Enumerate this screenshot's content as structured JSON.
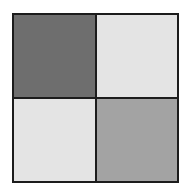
{
  "figure": {
    "name": "checkerboard-pattern",
    "background_color": "#ffffff",
    "frame": {
      "border_color": "#1c1c1c",
      "border_width_px": 2,
      "divider_color": "#1c1c1c",
      "divider_width_px": 2,
      "x": 12,
      "y": 13,
      "width": 167,
      "height": 170
    },
    "grid": {
      "rows": 2,
      "columns": 2
    },
    "quadrants": [
      {
        "position": "top-left",
        "label": "",
        "color": "#6e6e6e",
        "shade": "dark gray"
      },
      {
        "position": "top-right",
        "label": "",
        "color": "#e4e4e4",
        "shade": "light gray"
      },
      {
        "position": "bottom-left",
        "label": "",
        "color": "#e4e4e4",
        "shade": "light gray"
      },
      {
        "position": "bottom-right",
        "label": "",
        "color": "#a3a3a3",
        "shade": "medium gray"
      }
    ]
  }
}
